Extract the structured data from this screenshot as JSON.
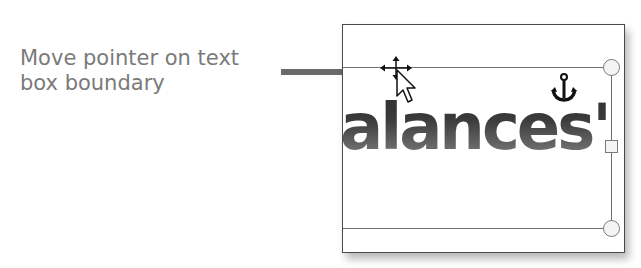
{
  "callout": {
    "line1": "Move pointer on text",
    "line2": "box boundary",
    "text_color": "#7a7a7a",
    "arrow_color": "#6a6a6a"
  },
  "document": {
    "text_content": "alances",
    "trailing_glyph": "'"
  },
  "icons": {
    "anchor": "anchor-icon",
    "cursor": "move-pointer-cursor-icon",
    "arrow": "callout-arrow-icon"
  },
  "handles": [
    {
      "type": "circle",
      "position": "top-right"
    },
    {
      "type": "square",
      "position": "middle-right"
    },
    {
      "type": "circle",
      "position": "bottom-right"
    }
  ]
}
